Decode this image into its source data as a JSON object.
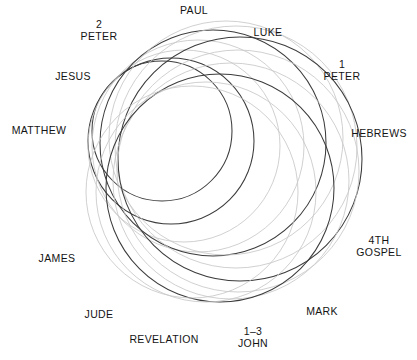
{
  "diagram": {
    "type": "spiral-venn",
    "title": "",
    "background_color": "#ffffff",
    "stroke_dark": "#3c3c3c",
    "stroke_light": "#c8c8c8",
    "labels": [
      {
        "id": "paul",
        "name": "PAUL",
        "lines": [
          "PAUL"
        ],
        "x": 194,
        "y": 11
      },
      {
        "id": "2-peter",
        "name": "2 PETER",
        "lines": [
          "2",
          "PETER"
        ],
        "x": 99,
        "y": 30
      },
      {
        "id": "luke",
        "name": "LUKE",
        "lines": [
          "LUKE"
        ],
        "x": 268,
        "y": 33
      },
      {
        "id": "jesus",
        "name": "JESUS",
        "lines": [
          "JESUS"
        ],
        "x": 73,
        "y": 77
      },
      {
        "id": "1-peter",
        "name": "1 PETER",
        "lines": [
          "1",
          "PETER"
        ],
        "x": 342,
        "y": 70
      },
      {
        "id": "matthew",
        "name": "MATTHEW",
        "lines": [
          "MATTHEW"
        ],
        "x": 39,
        "y": 131
      },
      {
        "id": "hebrews",
        "name": "HEBREWS",
        "lines": [
          "HEBREWS"
        ],
        "x": 379,
        "y": 134
      },
      {
        "id": "4th-gospel",
        "name": "4TH GOSPEL",
        "lines": [
          "4TH",
          "GOSPEL"
        ],
        "x": 379,
        "y": 246
      },
      {
        "id": "james",
        "name": "JAMES",
        "lines": [
          "JAMES"
        ],
        "x": 57,
        "y": 259
      },
      {
        "id": "jude",
        "name": "JUDE",
        "lines": [
          "JUDE"
        ],
        "x": 99,
        "y": 315
      },
      {
        "id": "mark",
        "name": "MARK",
        "lines": [
          "MARK"
        ],
        "x": 322,
        "y": 312
      },
      {
        "id": "revelation",
        "name": "REVELATION",
        "lines": [
          "REVELATION"
        ],
        "x": 164,
        "y": 340
      },
      {
        "id": "1-3-john",
        "name": "1-3 JOHN",
        "lines": [
          "1–3",
          "JOHN"
        ],
        "x": 253,
        "y": 337
      }
    ],
    "circles": [
      {
        "id": "circle-01",
        "cx": 162,
        "cy": 131,
        "r": 70,
        "shade": "dark"
      },
      {
        "id": "circle-02",
        "cx": 171,
        "cy": 141,
        "r": 83,
        "shade": "dark"
      },
      {
        "id": "circle-03",
        "cx": 184,
        "cy": 146,
        "r": 96,
        "shade": "light"
      },
      {
        "id": "circle-04",
        "cx": 198,
        "cy": 146,
        "r": 106,
        "shade": "light"
      },
      {
        "id": "circle-05",
        "cx": 213,
        "cy": 143,
        "r": 113,
        "shade": "dark"
      },
      {
        "id": "circle-06",
        "cx": 226,
        "cy": 138,
        "r": 117,
        "shade": "light"
      },
      {
        "id": "circle-07",
        "cx": 236,
        "cy": 147,
        "r": 121,
        "shade": "light"
      },
      {
        "id": "circle-08",
        "cx": 240,
        "cy": 159,
        "r": 122,
        "shade": "dark"
      },
      {
        "id": "circle-09",
        "cx": 238,
        "cy": 171,
        "r": 121,
        "shade": "light"
      },
      {
        "id": "circle-10",
        "cx": 231,
        "cy": 181,
        "r": 118,
        "shade": "light"
      },
      {
        "id": "circle-11",
        "cx": 220,
        "cy": 188,
        "r": 114,
        "shade": "dark"
      },
      {
        "id": "circle-12",
        "cx": 206,
        "cy": 192,
        "r": 110,
        "shade": "light"
      },
      {
        "id": "circle-13",
        "cx": 192,
        "cy": 192,
        "r": 106,
        "shade": "light"
      }
    ]
  }
}
